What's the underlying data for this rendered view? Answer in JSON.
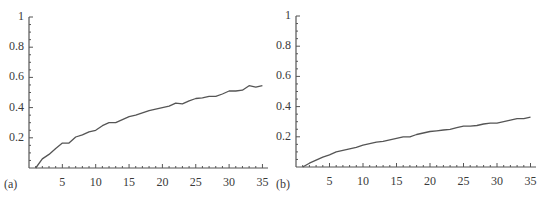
{
  "chart_data": [
    {
      "type": "line",
      "panel_label": "(a)",
      "title": "",
      "xlabel": "",
      "ylabel": "",
      "xlim": [
        0,
        36
      ],
      "ylim": [
        0,
        1
      ],
      "x_ticks": [
        5,
        10,
        15,
        20,
        25,
        30,
        35
      ],
      "x_tick_labels": [
        "5",
        "10",
        "15",
        "20",
        "25",
        "30",
        "35"
      ],
      "y_ticks": [
        0.2,
        0.4,
        0.6,
        0.8,
        1
      ],
      "y_tick_labels": [
        "0.2",
        "0.4",
        "0.6",
        "0.8",
        "1"
      ],
      "grid": false,
      "series": [
        {
          "name": "curve",
          "x": [
            1,
            2,
            3,
            4,
            5,
            6,
            7,
            8,
            9,
            10,
            11,
            12,
            13,
            14,
            15,
            16,
            17,
            18,
            19,
            20,
            21,
            22,
            23,
            24,
            25,
            26,
            27,
            28,
            29,
            30,
            31,
            32,
            33,
            34,
            35
          ],
          "values": [
            0.0,
            0.06,
            0.09,
            0.13,
            0.165,
            0.165,
            0.205,
            0.22,
            0.24,
            0.25,
            0.28,
            0.3,
            0.3,
            0.32,
            0.34,
            0.35,
            0.365,
            0.38,
            0.39,
            0.4,
            0.41,
            0.43,
            0.425,
            0.445,
            0.46,
            0.465,
            0.475,
            0.475,
            0.49,
            0.51,
            0.51,
            0.515,
            0.545,
            0.535,
            0.545
          ]
        }
      ]
    },
    {
      "type": "line",
      "panel_label": "(b)",
      "title": "",
      "xlabel": "",
      "ylabel": "",
      "xlim": [
        0,
        36
      ],
      "ylim": [
        0,
        1
      ],
      "x_ticks": [
        5,
        10,
        15,
        20,
        25,
        30,
        35
      ],
      "x_tick_labels": [
        "5",
        "10",
        "15",
        "20",
        "25",
        "30",
        "35"
      ],
      "y_ticks": [
        0.2,
        0.4,
        0.6,
        0.8,
        1
      ],
      "y_tick_labels": [
        "0.2",
        "0.4",
        "0.6",
        "0.8",
        "1"
      ],
      "grid": false,
      "series": [
        {
          "name": "curve",
          "x": [
            1,
            2,
            3,
            4,
            5,
            6,
            7,
            8,
            9,
            10,
            11,
            12,
            13,
            14,
            15,
            16,
            17,
            18,
            19,
            20,
            21,
            22,
            23,
            24,
            25,
            26,
            27,
            28,
            29,
            30,
            31,
            32,
            33,
            34,
            35
          ],
          "values": [
            0.0,
            0.025,
            0.045,
            0.065,
            0.08,
            0.1,
            0.11,
            0.12,
            0.13,
            0.145,
            0.155,
            0.165,
            0.17,
            0.18,
            0.19,
            0.2,
            0.2,
            0.215,
            0.225,
            0.235,
            0.24,
            0.245,
            0.25,
            0.26,
            0.27,
            0.27,
            0.275,
            0.285,
            0.29,
            0.29,
            0.3,
            0.31,
            0.32,
            0.32,
            0.33
          ]
        }
      ]
    }
  ],
  "style": {
    "line_color": "#555555",
    "axis_color": "#555555",
    "text_color": "#3a3a3a"
  }
}
